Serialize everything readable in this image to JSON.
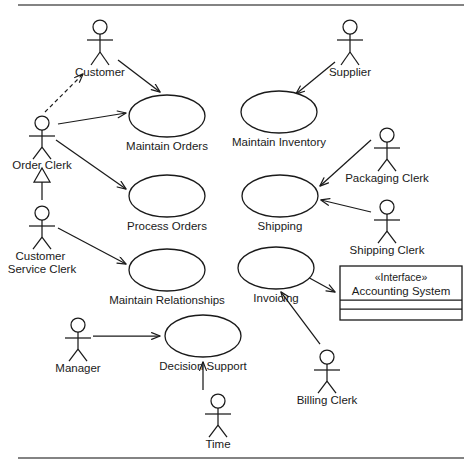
{
  "diagram": {
    "type": "uml-use-case-diagram",
    "title": "",
    "frame": {
      "top_rule_y": 5,
      "bottom_rule_y": 458,
      "rule_x_start": 18,
      "rule_x_end": 464,
      "rule_color": "#5a5a5a"
    },
    "stroke_color": "#1a1a1a",
    "fill_color": "#ffffff"
  },
  "actors": [
    {
      "id": "customer",
      "label": "Customer",
      "x": 100,
      "y": 22,
      "label_y": 66
    },
    {
      "id": "supplier",
      "label": "Supplier",
      "x": 350,
      "y": 22,
      "label_y": 66
    },
    {
      "id": "order-clerk",
      "label": "Order Clerk",
      "x": 42,
      "y": 118,
      "label_y": 162
    },
    {
      "id": "customer-service-clerk",
      "label": "Customer Service Clerk",
      "x": 42,
      "y": 208,
      "label_y": 252
    },
    {
      "id": "packaging-clerk",
      "label": "Packaging Clerk",
      "x": 387,
      "y": 130,
      "label_y": 174
    },
    {
      "id": "shipping-clerk",
      "label": "Shipping Clerk",
      "x": 387,
      "y": 202,
      "label_y": 246
    },
    {
      "id": "manager",
      "label": "Manager",
      "x": 78,
      "y": 320,
      "label_y": 364
    },
    {
      "id": "billing-clerk",
      "label": "Billing Clerk",
      "x": 327,
      "y": 352,
      "label_y": 396
    },
    {
      "id": "time",
      "label": "Time",
      "x": 218,
      "y": 396,
      "label_y": 440
    }
  ],
  "use_cases": [
    {
      "id": "maintain-orders",
      "label": "Maintain Orders",
      "cx": 167,
      "cy": 116,
      "rx": 38,
      "ry": 21,
      "label_y": 146
    },
    {
      "id": "maintain-inventory",
      "label": "Maintain Inventory",
      "cx": 279,
      "cy": 112,
      "rx": 38,
      "ry": 21,
      "label_y": 142
    },
    {
      "id": "process-orders",
      "label": "Process Orders",
      "cx": 167,
      "cy": 196,
      "rx": 38,
      "ry": 21,
      "label_y": 226
    },
    {
      "id": "shipping",
      "label": "Shipping",
      "cx": 280,
      "cy": 196,
      "rx": 38,
      "ry": 21,
      "label_y": 226
    },
    {
      "id": "maintain-relationships",
      "label": "Maintain Relationships",
      "cx": 167,
      "cy": 270,
      "rx": 38,
      "ry": 21,
      "label_y": 300
    },
    {
      "id": "invoicing",
      "label": "Invoicing",
      "cx": 276,
      "cy": 268,
      "rx": 38,
      "ry": 21,
      "label_y": 298
    },
    {
      "id": "decision-support",
      "label": "Decision Support",
      "cx": 203,
      "cy": 336,
      "rx": 38,
      "ry": 21,
      "label_y": 366
    }
  ],
  "interface_box": {
    "id": "accounting-system",
    "stereotype": "«Interface»",
    "name": "Accounting System",
    "x": 340,
    "y": 266,
    "width": 122,
    "height": 54,
    "compartments": [
      {
        "id": "name-compartment",
        "height": 34
      },
      {
        "id": "attributes-compartment",
        "height": 9
      },
      {
        "id": "operations-compartment",
        "height": 11
      }
    ]
  },
  "relationships": [
    {
      "id": "customer-to-maintain-orders",
      "kind": "association",
      "from": "customer",
      "to": "maintain-orders"
    },
    {
      "id": "order-clerk-to-maintain-orders",
      "kind": "association",
      "from": "order-clerk",
      "to": "maintain-orders"
    },
    {
      "id": "order-clerk-to-process-orders",
      "kind": "association",
      "from": "order-clerk",
      "to": "process-orders"
    },
    {
      "id": "order-clerk-to-customer-dependency",
      "kind": "dependency",
      "from": "order-clerk",
      "to": "customer"
    },
    {
      "id": "customer-service-clerk-generalizes-order-clerk",
      "kind": "generalization",
      "from": "customer-service-clerk",
      "to": "order-clerk"
    },
    {
      "id": "customer-service-clerk-to-maintain-relationships",
      "kind": "association",
      "from": "customer-service-clerk",
      "to": "maintain-relationships"
    },
    {
      "id": "supplier-to-maintain-inventory",
      "kind": "association",
      "from": "supplier",
      "to": "maintain-inventory"
    },
    {
      "id": "packaging-clerk-to-shipping",
      "kind": "association",
      "from": "packaging-clerk",
      "to": "shipping"
    },
    {
      "id": "shipping-clerk-to-shipping",
      "kind": "association",
      "from": "shipping-clerk",
      "to": "shipping"
    },
    {
      "id": "invoicing-to-accounting-system",
      "kind": "association",
      "from": "invoicing",
      "to": "accounting-system"
    },
    {
      "id": "billing-clerk-to-invoicing",
      "kind": "association",
      "from": "billing-clerk",
      "to": "invoicing"
    },
    {
      "id": "manager-to-decision-support",
      "kind": "association",
      "from": "manager",
      "to": "decision-support"
    },
    {
      "id": "time-to-decision-support",
      "kind": "association",
      "from": "time",
      "to": "decision-support"
    }
  ]
}
